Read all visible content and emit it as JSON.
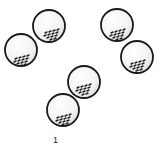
{
  "illustration": {
    "subject": "golf balls arranged in pairs",
    "groups": [
      {
        "name": "pair-left",
        "balls": [
          {
            "cx": 49,
            "cy": 26,
            "r": 16
          },
          {
            "cx": 21,
            "cy": 50,
            "r": 16
          }
        ]
      },
      {
        "name": "pair-right",
        "balls": [
          {
            "cx": 117,
            "cy": 25,
            "r": 16
          },
          {
            "cx": 137,
            "cy": 57,
            "r": 16
          }
        ]
      },
      {
        "name": "pair-bottom",
        "balls": [
          {
            "cx": 84,
            "cy": 82,
            "r": 16
          },
          {
            "cx": 63,
            "cy": 110,
            "r": 16
          }
        ]
      }
    ],
    "caption": "1",
    "colors": {
      "outline": "#1a1a1a",
      "fill": "#f4f4f4",
      "dimples": "#2a2a2a",
      "background": "#ffffff"
    }
  }
}
